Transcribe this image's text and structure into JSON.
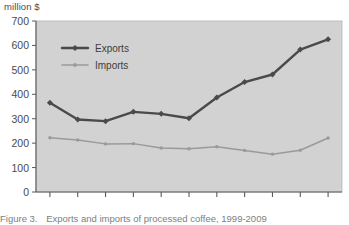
{
  "unit_label": "million $",
  "caption": {
    "number": "Figure 3.",
    "text": "Exports and imports of processed coffee, 1999-2009"
  },
  "colors": {
    "plot_background": "#d2d2d2",
    "frame": "#b3b3b3",
    "exports_line": "#4a4a4a",
    "imports_line": "#9a9a9a",
    "axis": "#5a5a5a",
    "text": "#4a4a4a"
  },
  "legend": {
    "position": "top-left-inside",
    "entries": [
      {
        "label": "Exports",
        "color": "#4a4a4a"
      },
      {
        "label": "Imports",
        "color": "#9a9a9a"
      }
    ]
  },
  "axes": {
    "y_ticks": [
      "700",
      "600",
      "500",
      "400",
      "300",
      "200",
      "100",
      "0"
    ],
    "y_values": [
      700,
      600,
      500,
      400,
      300,
      200,
      100,
      0
    ],
    "x_ticks": [
      "1999",
      "2000",
      "2001",
      "2002",
      "2003",
      "2004",
      "2005",
      "2006",
      "2007",
      "2008",
      "2009"
    ]
  },
  "chart_data": {
    "type": "line",
    "title": "Exports and imports of processed coffee, 1999-2009",
    "xlabel": "",
    "ylabel": "million $",
    "ylim": [
      0,
      700
    ],
    "ytick_step": 100,
    "grid": false,
    "legend_position": "top-left-inside",
    "x": [
      1999,
      2000,
      2001,
      2002,
      2003,
      2004,
      2005,
      2006,
      2007,
      2008,
      2009
    ],
    "categories": [
      "1999",
      "2000",
      "2001",
      "2002",
      "2003",
      "2004",
      "2005",
      "2006",
      "2007",
      "2008",
      "2009"
    ],
    "series": [
      {
        "name": "Exports",
        "color": "#4a4a4a",
        "values": [
          365,
          297,
          290,
          328,
          320,
          302,
          387,
          450,
          481,
          583,
          625
        ]
      },
      {
        "name": "Imports",
        "color": "#9a9a9a",
        "values": [
          222,
          213,
          197,
          198,
          180,
          177,
          185,
          170,
          155,
          171,
          221
        ]
      }
    ]
  }
}
